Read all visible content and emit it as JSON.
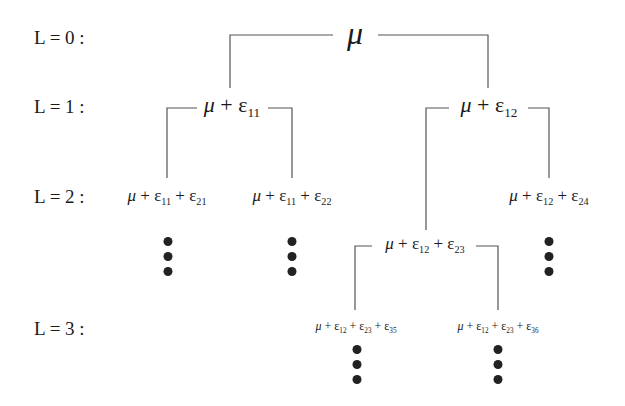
{
  "levels": [
    {
      "label": "L = 0 :"
    },
    {
      "label": "L = 1 :"
    },
    {
      "label": "L = 2 :"
    },
    {
      "label": "L = 3 :"
    }
  ],
  "nodes": {
    "root": {
      "mu": "μ"
    },
    "n11": {
      "mu": "μ",
      "rest": " + ε",
      "sub": "11"
    },
    "n12": {
      "mu": "μ",
      "rest": " + ε",
      "sub": "12"
    },
    "n21": {
      "mu": "μ",
      "p1": " + ε",
      "s1": "11",
      "p2": " + ε",
      "s2": "21"
    },
    "n22": {
      "mu": "μ",
      "p1": " + ε",
      "s1": "11",
      "p2": " + ε",
      "s2": "22"
    },
    "n24": {
      "mu": "μ",
      "p1": " + ε",
      "s1": "12",
      "p2": " + ε",
      "s2": "24"
    },
    "n23": {
      "mu": "μ",
      "p1": " + ε",
      "s1": "12",
      "p2": " + ε",
      "s2": "23"
    },
    "n35": {
      "mu": "μ",
      "p1": " + ε",
      "s1": "12",
      "p2": " + ε",
      "s2": "23",
      "p3": " + ε",
      "s3": "35"
    },
    "n36": {
      "mu": "μ",
      "p1": " + ε",
      "s1": "12",
      "p2": " + ε",
      "s2": "23",
      "p3": " + ε",
      "s3": "36"
    }
  },
  "ellipsis_symbol": "⋮"
}
